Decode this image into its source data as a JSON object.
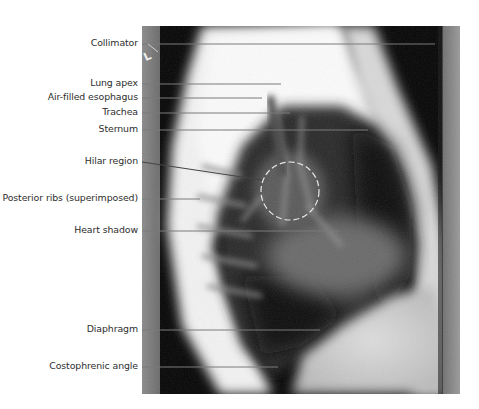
{
  "figure": {
    "image_type": "lateral chest radiograph",
    "marker": "L",
    "labels": [
      {
        "text": "Collimator",
        "y": 44,
        "line_end_x": 435,
        "line_end_y": 44
      },
      {
        "text": "Lung apex",
        "y": 84,
        "line_end_x": 281,
        "line_end_y": 84
      },
      {
        "text": "Air-filled esophagus",
        "y": 98,
        "line_end_x": 262,
        "line_end_y": 98
      },
      {
        "text": "Trachea",
        "y": 113,
        "line_end_x": 290,
        "line_end_y": 113
      },
      {
        "text": "Sternum",
        "y": 130,
        "line_end_x": 368,
        "line_end_y": 130
      },
      {
        "text": "Hilar region",
        "y": 162,
        "line_end_x": 262,
        "line_end_y": 180
      },
      {
        "text": "Posterior ribs (superimposed)",
        "y": 199,
        "line_end_x": 200,
        "line_end_y": 199
      },
      {
        "text": "Heart shadow",
        "y": 231,
        "line_end_x": 340,
        "line_end_y": 231
      },
      {
        "text": "Diaphragm",
        "y": 330,
        "line_end_x": 320,
        "line_end_y": 330
      },
      {
        "text": "Costophrenic angle",
        "y": 367,
        "line_end_x": 278,
        "line_end_y": 367
      }
    ],
    "hilar_circle": {
      "cx": 290,
      "cy": 191,
      "r": 29
    },
    "colors": {
      "label_text": "#2e2e2e",
      "leader_line": "#7a7a7a",
      "circle": "#e8e8e8"
    }
  }
}
